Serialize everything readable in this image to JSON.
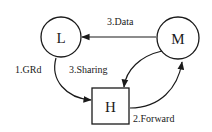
{
  "diagram": {
    "type": "state-transition",
    "nodes": [
      {
        "id": "L",
        "label": "L",
        "shape": "circle"
      },
      {
        "id": "M",
        "label": "M",
        "shape": "circle"
      },
      {
        "id": "H",
        "label": "H",
        "shape": "square"
      }
    ],
    "edges": [
      {
        "from": "L",
        "to": "H",
        "label": "1.GRd"
      },
      {
        "from": "H",
        "to": "M",
        "label": "2.Forward"
      },
      {
        "from": "M",
        "to": "L",
        "label": "3.Data"
      },
      {
        "from": "M",
        "to": "H",
        "label": "3.Sharing"
      }
    ]
  },
  "colors": {
    "stroke": "#1a1a1a",
    "background": "#ffffff"
  }
}
